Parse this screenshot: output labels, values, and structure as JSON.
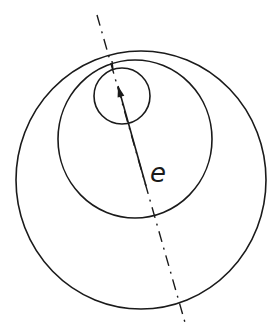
{
  "diagram": {
    "stroke_color": "#1a1a1a",
    "background_color": "#ffffff",
    "circles": [
      {
        "name": "outer-circle",
        "cx": 141,
        "cy": 180,
        "rx": 125,
        "ry": 129
      },
      {
        "name": "middle-circle",
        "cx": 135,
        "cy": 139,
        "rx": 77,
        "ry": 79
      },
      {
        "name": "small-circle",
        "cx": 122,
        "cy": 96,
        "rx": 28,
        "ry": 28
      }
    ],
    "axis_line": {
      "x1": 97,
      "y1": 15,
      "x2": 186,
      "y2": 326,
      "style": "dash-dot"
    },
    "arrow": {
      "x1": 146,
      "y1": 186,
      "x2": 118,
      "y2": 86
    },
    "tick_mark": {
      "x1": 112,
      "y1": 61,
      "x2": 113,
      "y2": 70
    },
    "label": {
      "text": "e",
      "x": 150,
      "y": 160
    }
  }
}
